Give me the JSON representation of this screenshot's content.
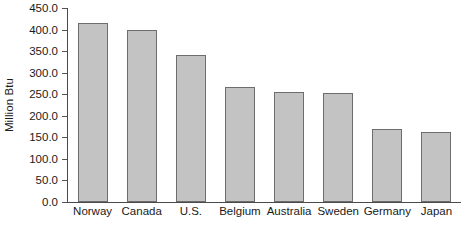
{
  "chart_data": {
    "type": "bar",
    "title": "",
    "subtitle": "",
    "xlabel": "",
    "ylabel": "Million Btu",
    "categories": [
      "Norway",
      "Canada",
      "U.S.",
      "Belgium",
      "Australia",
      "Sweden",
      "Germany",
      "Japan"
    ],
    "values": [
      415,
      400,
      342,
      266,
      256,
      253,
      170,
      163
    ],
    "ylim": [
      0,
      450
    ],
    "ytick_step": 50,
    "ytick_labels": [
      "0.0",
      "50.0",
      "100.0",
      "150.0",
      "200.0",
      "250.0",
      "300.0",
      "350.0",
      "400.0",
      "450.0"
    ],
    "ytick_values": [
      0,
      50,
      100,
      150,
      200,
      250,
      300,
      350,
      400,
      450
    ],
    "grid": false,
    "legend": null,
    "legend_position": "none",
    "bar_fill_color": "#c3c3c3",
    "bar_border_color": "#6d6d6d",
    "axis_color": "#4a4a4a",
    "background_color": "#ffffff",
    "text_color": "#1a1a1a"
  }
}
